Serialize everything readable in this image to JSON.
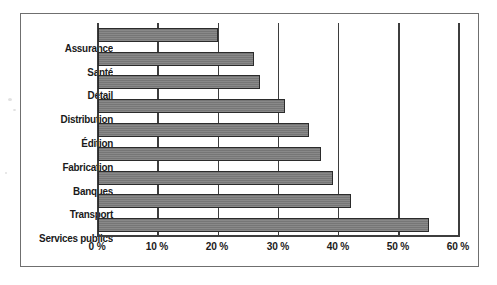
{
  "chart_data": {
    "type": "bar",
    "orientation": "horizontal",
    "title": "",
    "subtitle": "",
    "xlabel": "",
    "ylabel": "",
    "categories": [
      "Assurance",
      "Santé",
      "Détail",
      "Distribution",
      "Édition",
      "Fabrication",
      "Banques",
      "Transport",
      "Services publics"
    ],
    "values": [
      20,
      26,
      27,
      31,
      35,
      37,
      39,
      42,
      55
    ],
    "value_unit": "%",
    "xlim": [
      0,
      60
    ],
    "xticks": [
      0,
      10,
      20,
      30,
      40,
      50,
      60
    ],
    "xtick_labels": [
      "0 %",
      "10 %",
      "20 %",
      "30 %",
      "40 %",
      "50 %",
      "60 %"
    ],
    "grid": "vertical",
    "legend": "none",
    "bar_color": "#7c7c7c",
    "bar_border_color": "#2b2b2b",
    "axis_color": "#3d3d3d",
    "frame_color": "#6f6f6f",
    "background_color": "#ffffff"
  }
}
